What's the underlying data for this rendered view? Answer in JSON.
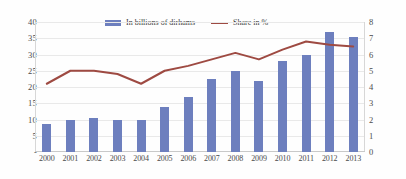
{
  "chart_data": {
    "type": "bar",
    "title": "",
    "subtitle": "",
    "xlabel": "",
    "ylabel": "",
    "categories": [
      "2000",
      "2001",
      "2002",
      "2003",
      "2004",
      "2005",
      "2006",
      "2007",
      "2008",
      "2009",
      "2010",
      "2011",
      "2012",
      "2013"
    ],
    "series": [
      {
        "name": "In billions of dirhams",
        "type": "bar",
        "axis": "left",
        "color": "#6d7fbe",
        "values": [
          8.5,
          10.0,
          10.5,
          10.0,
          9.8,
          13.7,
          16.8,
          22.5,
          25.0,
          22.0,
          28.0,
          30.0,
          37.0,
          35.5
        ]
      },
      {
        "name": "Share in %",
        "type": "line",
        "axis": "right",
        "color": "#9e4a42",
        "values": [
          4.2,
          5.0,
          5.0,
          4.8,
          4.2,
          5.0,
          5.3,
          5.7,
          6.1,
          5.7,
          6.3,
          6.8,
          6.6,
          6.5
        ]
      }
    ],
    "left_axis": {
      "min": 0,
      "max": 40,
      "step": 5,
      "ticks": [
        "40",
        "35",
        "30",
        "25",
        "20",
        "15",
        "10",
        "5",
        "-"
      ]
    },
    "right_axis": {
      "min": 0,
      "max": 8,
      "step": 1,
      "ticks": [
        "8",
        "7",
        "6",
        "5",
        "4",
        "3",
        "2",
        "1",
        "0"
      ]
    },
    "grid": true,
    "legend_position": "top-center",
    "legend": [
      {
        "label": "In billions of dirhams",
        "marker": "bar-swatch",
        "color": "#6d7fbe"
      },
      {
        "label": "Share in %",
        "marker": "line-swatch",
        "color": "#9e4a42"
      }
    ]
  }
}
